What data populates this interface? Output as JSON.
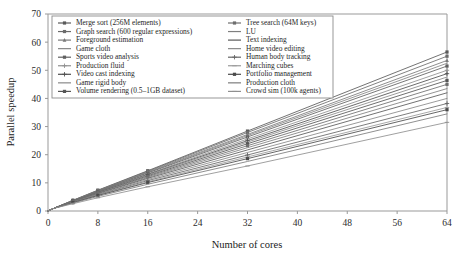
{
  "chart_data": {
    "type": "line",
    "title": "",
    "xlabel": "Number of cores",
    "ylabel": "Parallel speedup",
    "xlim": [
      0,
      64
    ],
    "ylim": [
      0,
      70
    ],
    "xticks": [
      0,
      8,
      16,
      24,
      32,
      40,
      48,
      56,
      64
    ],
    "yticks": [
      0,
      10,
      20,
      30,
      40,
      50,
      60,
      70
    ],
    "xticklabels": [
      "0",
      "8",
      "16",
      "24",
      "32",
      "40",
      "48",
      "56",
      "64"
    ],
    "yticklabels": [
      "0",
      "10",
      "20",
      "30",
      "40",
      "50",
      "60",
      "70"
    ],
    "grid": false,
    "legend_position": "upper-left-inside",
    "legend_columns": 2,
    "x": [
      1,
      2,
      4,
      8,
      16,
      32,
      64
    ],
    "series": [
      {
        "name": "Merge sort (256M elements)",
        "color": "#5a5a5a",
        "marker": "square",
        "values": [
          1.0,
          1.95,
          3.8,
          7.4,
          14.3,
          28.4,
          56.5
        ]
      },
      {
        "name": "Graph search (600 regular expressions)",
        "color": "#6b6b6b",
        "marker": "square",
        "values": [
          1.0,
          1.93,
          3.75,
          7.3,
          14.1,
          27.9,
          55.0
        ]
      },
      {
        "name": "Foreground estimation",
        "color": "#7a7a7a",
        "marker": "triangle",
        "values": [
          1.0,
          1.9,
          3.7,
          7.2,
          13.9,
          27.2,
          53.5
        ]
      },
      {
        "name": "Game cloth",
        "color": "#858585",
        "marker": "none",
        "values": [
          1.0,
          1.9,
          3.68,
          7.1,
          13.7,
          26.8,
          52.5
        ]
      },
      {
        "name": "Sports video analysis",
        "color": "#606060",
        "marker": "square",
        "values": [
          1.0,
          1.88,
          3.65,
          7.05,
          13.5,
          26.3,
          51.5
        ]
      },
      {
        "name": "Production fluid",
        "color": "#909090",
        "marker": "plus",
        "values": [
          1.0,
          1.86,
          3.6,
          6.95,
          13.2,
          25.6,
          50.0
        ]
      },
      {
        "name": "Video cast indexing",
        "color": "#4f4f4f",
        "marker": "plus",
        "values": [
          1.0,
          1.85,
          3.55,
          6.85,
          13.0,
          25.0,
          48.8
        ]
      },
      {
        "name": "Game rigid body",
        "color": "#8a8a8a",
        "marker": "none",
        "values": [
          1.0,
          1.83,
          3.5,
          6.75,
          12.8,
          24.5,
          47.6
        ]
      },
      {
        "name": "Volume rendering (0.5–1GB dataset)",
        "color": "#555555",
        "marker": "square",
        "values": [
          1.0,
          1.82,
          3.45,
          6.6,
          12.5,
          23.9,
          46.4
        ]
      },
      {
        "name": "Tree search (64M keys)",
        "color": "#6e6e6e",
        "marker": "square",
        "values": [
          1.0,
          1.8,
          3.4,
          6.5,
          12.2,
          23.2,
          45.0
        ]
      },
      {
        "name": "LU",
        "color": "#7f7f7f",
        "marker": "none",
        "values": [
          1.0,
          1.78,
          3.35,
          6.35,
          11.9,
          22.5,
          43.5
        ]
      },
      {
        "name": "Text indexing",
        "color": "#595959",
        "marker": "none",
        "values": [
          1.0,
          1.75,
          3.28,
          6.2,
          11.6,
          21.7,
          42.0
        ]
      },
      {
        "name": "Home video editing",
        "color": "#888888",
        "marker": "none",
        "values": [
          1.0,
          1.72,
          3.2,
          6.0,
          11.2,
          20.8,
          40.0
        ]
      },
      {
        "name": "Human body tracking",
        "color": "#656565",
        "marker": "plus",
        "values": [
          1.0,
          1.7,
          3.1,
          5.8,
          10.8,
          19.9,
          38.2
        ]
      },
      {
        "name": "Marching cubes",
        "color": "#9a9a9a",
        "marker": "dash",
        "values": [
          1.0,
          1.68,
          3.05,
          5.65,
          10.4,
          19.2,
          36.8
        ]
      },
      {
        "name": "Portfolio management",
        "color": "#4a4a4a",
        "marker": "square",
        "values": [
          1.0,
          1.66,
          3.0,
          5.5,
          10.1,
          18.6,
          36.0
        ]
      },
      {
        "name": "Production cloth",
        "color": "#7c7c7c",
        "marker": "none",
        "values": [
          1.0,
          1.6,
          2.85,
          5.2,
          9.5,
          17.6,
          34.5
        ]
      },
      {
        "name": "Crowd sim (100k agents)",
        "color": "#8f8f8f",
        "marker": "dash",
        "values": [
          1.0,
          1.5,
          2.6,
          4.7,
          8.6,
          16.0,
          31.5
        ]
      }
    ]
  },
  "legend": {
    "columns": [
      {
        "items": [
          "Merge sort (256M elements)",
          "Graph search (600 regular expressions)",
          "Foreground estimation",
          "Game cloth",
          "Sports video analysis",
          "Production fluid",
          "Video cast indexing",
          "Game rigid body",
          "Volume rendering (0.5–1GB dataset)"
        ]
      },
      {
        "items": [
          "Tree search (64M keys)",
          "LU",
          "Text indexing",
          "Home video editing",
          "Human body tracking",
          "Marching cubes",
          "Portfolio management",
          "Production cloth",
          "Crowd sim (100k agents)"
        ]
      }
    ]
  },
  "colors": {
    "background": "#ffffff",
    "axis": "#999999",
    "text": "#1a1a1a",
    "legend_border": "#8c8c8c"
  }
}
